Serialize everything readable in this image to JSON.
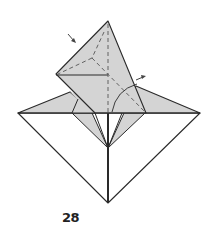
{
  "diagram": {
    "type": "origami-folding-step",
    "step_number": "28",
    "colors": {
      "paper_colored": "#d4d4d4",
      "paper_white": "#ffffff",
      "line": "#2a2a2a",
      "fold_line": "#555555"
    },
    "annotations": [
      {
        "kind": "arrow",
        "name": "push-arrow-left",
        "direction": "down-right"
      },
      {
        "kind": "arrow",
        "name": "fold-arrow-right",
        "direction": "up-right"
      },
      {
        "kind": "arc",
        "name": "fold-motion-arc"
      },
      {
        "kind": "dashed-line",
        "name": "valley-fold-lines"
      }
    ]
  }
}
